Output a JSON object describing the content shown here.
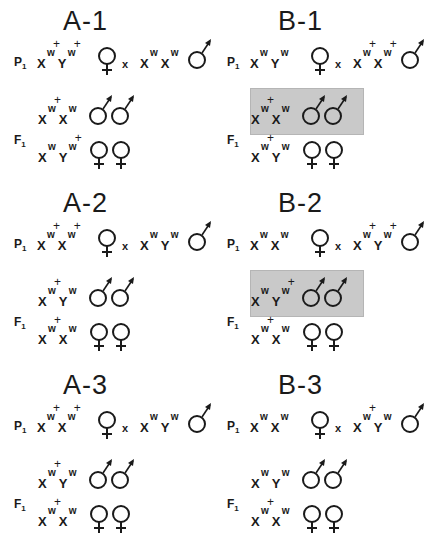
{
  "figure": {
    "panels": [
      {
        "id": "A-1",
        "title": "A-1",
        "p1": {
          "label": "P",
          "sub": "1",
          "left": [
            {
              "c": "X",
              "s": "w",
              "plus": true
            },
            {
              "c": "Y",
              "s": "w",
              "plus": true
            }
          ],
          "left_symbol": "female",
          "cross": "x",
          "right": [
            {
              "c": "X",
              "s": "w",
              "plus": false
            },
            {
              "c": "X",
              "s": "w",
              "plus": false
            }
          ],
          "right_symbol": "male"
        },
        "f1": {
          "label": "F",
          "sub": "1",
          "rows": [
            {
              "alleles": [
                {
                  "c": "X",
                  "s": "w",
                  "plus": true
                },
                {
                  "c": "X",
                  "s": "w",
                  "plus": false
                }
              ],
              "symbols": "male-male",
              "shaded": false
            },
            {
              "alleles": [
                {
                  "c": "X",
                  "s": "w",
                  "plus": false
                },
                {
                  "c": "Y",
                  "s": "w",
                  "plus": true
                }
              ],
              "symbols": "female-female",
              "shaded": false
            }
          ]
        }
      },
      {
        "id": "B-1",
        "title": "B-1",
        "p1": {
          "label": "P",
          "sub": "1",
          "left": [
            {
              "c": "X",
              "s": "w",
              "plus": false
            },
            {
              "c": "Y",
              "s": "w",
              "plus": false
            }
          ],
          "left_symbol": "female",
          "cross": "x",
          "right": [
            {
              "c": "X",
              "s": "w",
              "plus": true
            },
            {
              "c": "X",
              "s": "w",
              "plus": true
            }
          ],
          "right_symbol": "male"
        },
        "f1": {
          "label": "F",
          "sub": "1",
          "rows": [
            {
              "alleles": [
                {
                  "c": "X",
                  "s": "w",
                  "plus": true
                },
                {
                  "c": "X",
                  "s": "w",
                  "plus": false
                }
              ],
              "symbols": "male-male",
              "shaded": true
            },
            {
              "alleles": [
                {
                  "c": "X",
                  "s": "w",
                  "plus": true
                },
                {
                  "c": "Y",
                  "s": "w",
                  "plus": false
                }
              ],
              "symbols": "female-female",
              "shaded": false
            }
          ]
        }
      },
      {
        "id": "A-2",
        "title": "A-2",
        "p1": {
          "label": "P",
          "sub": "1",
          "left": [
            {
              "c": "X",
              "s": "w",
              "plus": true
            },
            {
              "c": "X",
              "s": "w",
              "plus": true
            }
          ],
          "left_symbol": "female",
          "cross": "x",
          "right": [
            {
              "c": "X",
              "s": "w",
              "plus": false
            },
            {
              "c": "Y",
              "s": "w",
              "plus": false
            }
          ],
          "right_symbol": "male"
        },
        "f1": {
          "label": "F",
          "sub": "1",
          "rows": [
            {
              "alleles": [
                {
                  "c": "X",
                  "s": "w",
                  "plus": true
                },
                {
                  "c": "Y",
                  "s": "w",
                  "plus": false
                }
              ],
              "symbols": "male-male",
              "shaded": false
            },
            {
              "alleles": [
                {
                  "c": "X",
                  "s": "w",
                  "plus": true
                },
                {
                  "c": "X",
                  "s": "w",
                  "plus": false
                }
              ],
              "symbols": "female-female",
              "shaded": false
            }
          ]
        }
      },
      {
        "id": "B-2",
        "title": "B-2",
        "p1": {
          "label": "P",
          "sub": "1",
          "left": [
            {
              "c": "X",
              "s": "w",
              "plus": false
            },
            {
              "c": "X",
              "s": "w",
              "plus": false
            }
          ],
          "left_symbol": "female",
          "cross": "x",
          "right": [
            {
              "c": "X",
              "s": "w",
              "plus": true
            },
            {
              "c": "Y",
              "s": "w",
              "plus": true
            }
          ],
          "right_symbol": "male"
        },
        "f1": {
          "label": "F",
          "sub": "1",
          "rows": [
            {
              "alleles": [
                {
                  "c": "X",
                  "s": "w",
                  "plus": false
                },
                {
                  "c": "Y",
                  "s": "w",
                  "plus": true
                }
              ],
              "symbols": "male-male",
              "shaded": true
            },
            {
              "alleles": [
                {
                  "c": "X",
                  "s": "w",
                  "plus": true
                },
                {
                  "c": "X",
                  "s": "w",
                  "plus": false
                }
              ],
              "symbols": "female-female",
              "shaded": false
            }
          ]
        }
      },
      {
        "id": "A-3",
        "title": "A-3",
        "p1": {
          "label": "P",
          "sub": "1",
          "left": [
            {
              "c": "X",
              "s": "w",
              "plus": true
            },
            {
              "c": "X",
              "s": "w",
              "plus": true
            }
          ],
          "left_symbol": "female",
          "cross": "x",
          "right": [
            {
              "c": "X",
              "s": "w",
              "plus": false
            },
            {
              "c": "Y",
              "s": "w",
              "plus": false
            }
          ],
          "right_symbol": "male"
        },
        "f1": {
          "label": "F",
          "sub": "1",
          "rows": [
            {
              "alleles": [
                {
                  "c": "X",
                  "s": "w",
                  "plus": true
                },
                {
                  "c": "Y",
                  "s": "w",
                  "plus": false
                }
              ],
              "symbols": "male-male",
              "shaded": false
            },
            {
              "alleles": [
                {
                  "c": "X",
                  "s": "w",
                  "plus": true
                },
                {
                  "c": "X",
                  "s": "w",
                  "plus": false
                }
              ],
              "symbols": "female-female",
              "shaded": false
            }
          ]
        }
      },
      {
        "id": "B-3",
        "title": "B-3",
        "p1": {
          "label": "P",
          "sub": "1",
          "left": [
            {
              "c": "X",
              "s": "w",
              "plus": false
            },
            {
              "c": "X",
              "s": "w",
              "plus": false
            }
          ],
          "left_symbol": "female",
          "cross": "x",
          "right": [
            {
              "c": "X",
              "s": "w",
              "plus": true
            },
            {
              "c": "Y",
              "s": "w",
              "plus": false
            }
          ],
          "right_symbol": "male"
        },
        "f1": {
          "label": "F",
          "sub": "1",
          "rows": [
            {
              "alleles": [
                {
                  "c": "X",
                  "s": "w",
                  "plus": false
                },
                {
                  "c": "Y",
                  "s": "w",
                  "plus": false
                }
              ],
              "symbols": "male-male",
              "shaded": false
            },
            {
              "alleles": [
                {
                  "c": "X",
                  "s": "w",
                  "plus": true
                },
                {
                  "c": "X",
                  "s": "w",
                  "plus": false
                }
              ],
              "symbols": "female-female",
              "shaded": false
            }
          ]
        }
      }
    ],
    "shade_color": "#c9c9c9"
  }
}
